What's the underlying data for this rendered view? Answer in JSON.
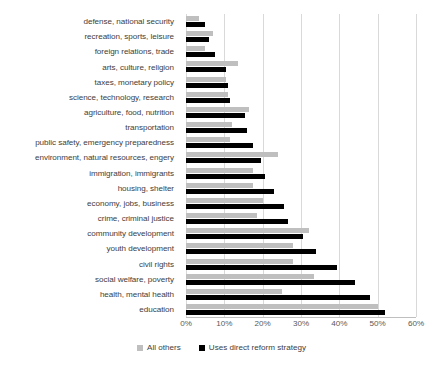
{
  "chart_data": {
    "type": "bar",
    "orientation": "horizontal",
    "title": "",
    "subtitle": "",
    "xlabel": "",
    "ylabel": "",
    "xlim": [
      0,
      60
    ],
    "xticks": [
      "0%",
      "10%",
      "20%",
      "30%",
      "40%",
      "50%",
      "60%"
    ],
    "xtick_values": [
      0,
      10,
      20,
      30,
      40,
      50,
      60
    ],
    "grid": true,
    "grid_axis": "x",
    "legend_position": "bottom",
    "value_unit": "percent",
    "categories": [
      "defense, national security",
      "recreation, sports, leisure",
      "foreign relations, trade",
      "arts, culture, religion",
      "taxes, monetary policy",
      "science, technology, research",
      "agriculture, food, nutrition",
      "transportation",
      "public safety, emergency preparedness",
      "environment, natural resources, engery",
      "immigration, immigrants",
      "housing, shelter",
      "economy, jobs, business",
      "crime, criminal justice",
      "community development",
      "youth development",
      "civil rights",
      "social welfare, poverty",
      "health, mental health",
      "education"
    ],
    "series": [
      {
        "name": "All others",
        "color": "#bfbfbf",
        "values": [
          3.5,
          7.0,
          5.0,
          13.5,
          10.5,
          11.0,
          16.5,
          12.0,
          11.5,
          24.0,
          17.5,
          17.5,
          20.0,
          18.5,
          32.0,
          28.0,
          28.0,
          33.5,
          25.0,
          50.0
        ]
      },
      {
        "name": "Uses direct reform strategy",
        "color": "#000000",
        "values": [
          5.0,
          6.0,
          7.5,
          10.5,
          11.0,
          11.5,
          15.5,
          16.0,
          17.5,
          19.5,
          20.5,
          23.0,
          25.5,
          26.5,
          30.5,
          34.0,
          39.5,
          44.0,
          48.0,
          52.0
        ]
      }
    ]
  },
  "legend": {
    "items": [
      {
        "label": "All others",
        "color": "#bfbfbf"
      },
      {
        "label": "Uses direct reform strategy",
        "color": "#000000"
      }
    ]
  },
  "colors": {
    "gridline": "#d9d9d9",
    "axis": "#bfbfbf",
    "label_text": "#404040",
    "tick_text": "#595959",
    "background": "#ffffff"
  }
}
